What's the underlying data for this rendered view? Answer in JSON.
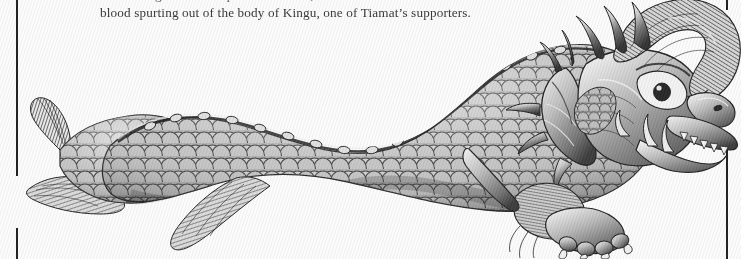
{
  "page": {
    "background_color": "#ffffff",
    "width": 741,
    "height": 259
  },
  "caption": {
    "line_1_clipped": "a mere fragment of the pictorial record, it is also linked from the",
    "line_2": "blood spurting out of the body of Kingu, one of Tiamat’s supporters.",
    "text_color": "#2b2b2b"
  },
  "rules": {
    "color": "#111111",
    "left_label": "left-column-rule",
    "right_label": "right-column-rule"
  },
  "illustration": {
    "title": "Engraving of a scaled dragon / sea-serpent",
    "subject": "Kingu, one of Tiamat’s supporters",
    "style": "black-and-white line engraving",
    "ink_color": "#1b1b1b",
    "midtone_color": "#8d8d8d",
    "highlight_color": "#f2f2f2",
    "parts": [
      {
        "name": "tail-fin",
        "label": "Tail fin"
      },
      {
        "name": "tail-fluke",
        "label": "Lower tail fluke"
      },
      {
        "name": "scaled-body",
        "label": "Scaled serpentine body"
      },
      {
        "name": "dorsal-ridge",
        "label": "Dorsal ridge"
      },
      {
        "name": "mid-fin",
        "label": "Mid-body fin"
      },
      {
        "name": "frill",
        "label": "Neck frill"
      },
      {
        "name": "horns",
        "label": "Head horns"
      },
      {
        "name": "mane",
        "label": "Swept-back mane"
      },
      {
        "name": "eye",
        "label": "Eye"
      },
      {
        "name": "snout",
        "label": "Snout"
      },
      {
        "name": "jaw-teeth",
        "label": "Jaw with teeth"
      },
      {
        "name": "clawed-foot",
        "label": "Clawed foot"
      }
    ]
  }
}
